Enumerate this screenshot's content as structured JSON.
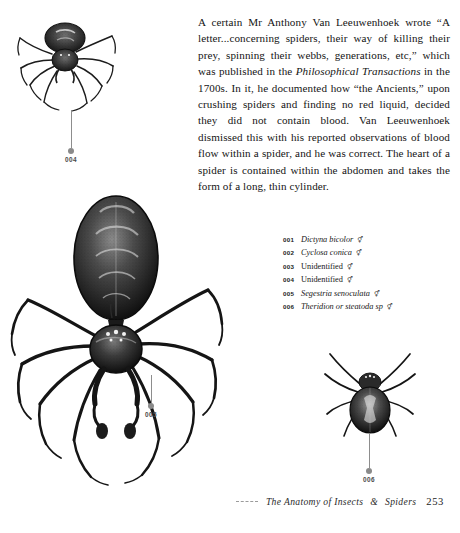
{
  "page": {
    "body_paragraph": "A certain Mr Anthony Van Leeuwenhoek wrote “A letter...concerning spiders, their way of killing their prey, spinning their webbs, generations, etc,” which was published in the Philosophical Transactions in the 1700s. In it, he documented how “the Ancients,” upon crushing spiders and finding no red liquid, decided they did not contain blood. Van Leeuwenhoek dismissed this with his reported observations of blood flow within a spider, and he was correct. The heart of a spider is contained within the abdomen and takes the form of a long, thin cylinder.",
    "body_segments": {
      "part1": "A certain Mr Anthony Van Leeuwenhoek wrote “A letter...concerning spiders, their way of killing their prey, spinning their webbs, generations, etc,” which was published in the ",
      "italic1": "Philosophical Transactions",
      "part2": " in the 1700s. In it, he documented how “the Ancients,” upon crushing spiders and finding no red liquid, decided they did not contain blood. Van Leeuwenhoek dismissed this with his reported observations of blood flow within a spider, and he was correct. The heart of a spider is contained within the abdomen and takes the form of a long, thin cylinder."
    }
  },
  "legend": {
    "items": [
      {
        "num": "001",
        "name": "Dictyna bicolor",
        "italic": true,
        "symbol": "⚥"
      },
      {
        "num": "002",
        "name": "Cyclosa conica",
        "italic": true,
        "symbol": "⚥"
      },
      {
        "num": "003",
        "name": "Unidentified",
        "italic": false,
        "symbol": "⚥"
      },
      {
        "num": "004",
        "name": "Unidentified",
        "italic": false,
        "symbol": "⚥"
      },
      {
        "num": "005",
        "name": "Segestria senoculata",
        "italic": true,
        "symbol": "⚥"
      },
      {
        "num": "006",
        "name": "Theridion or steatoda sp",
        "italic": true,
        "symbol": "⚥"
      }
    ]
  },
  "callouts": {
    "c004": "004",
    "c005": "005",
    "c006": "006"
  },
  "illustrations": [
    {
      "id": "illo-004",
      "label": "spider-illustration-004",
      "callout": "004"
    },
    {
      "id": "illo-005",
      "label": "spider-illustration-005",
      "callout": "005"
    },
    {
      "id": "illo-006",
      "label": "spider-illustration-006",
      "callout": "006"
    }
  ],
  "footer": {
    "title": "The Anatomy of Insects",
    "ampersand": "&",
    "title_tail": "Spiders",
    "page_number": "253"
  },
  "colors": {
    "ink": "#141414",
    "leader": "#8a8a8a",
    "paper": "#ffffff"
  }
}
